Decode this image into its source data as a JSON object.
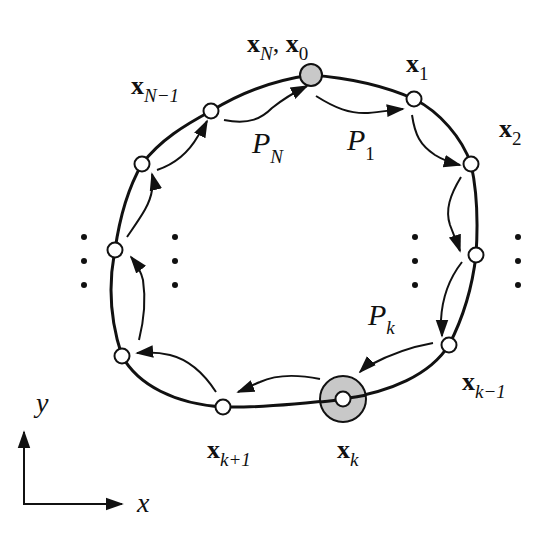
{
  "diagram": {
    "type": "closed-orbit-shooting",
    "colors": {
      "stroke": "#111111",
      "node_fill": "#ffffff",
      "highlight_fill": "#c8c8c8"
    },
    "nodes": [
      {
        "id": "x0",
        "label_main": "x",
        "label_sub": "N",
        "label_sep": ", ",
        "label_main2": "x",
        "label_sub2": "0",
        "highlighted": true
      },
      {
        "id": "x1",
        "label_main": "x",
        "label_sub": "1"
      },
      {
        "id": "x2",
        "label_main": "x",
        "label_sub": "2"
      },
      {
        "id": "xkm1",
        "label_main": "x",
        "label_sub": "k−1"
      },
      {
        "id": "xk",
        "label_main": "x",
        "label_sub": "k",
        "highlighted": true
      },
      {
        "id": "xkp1",
        "label_main": "x",
        "label_sub": "k+1"
      },
      {
        "id": "xNm1",
        "label_main": "x",
        "label_sub": "N−1"
      }
    ],
    "maps": [
      {
        "label_main": "P",
        "label_sub": "N"
      },
      {
        "label_main": "P",
        "label_sub": "1"
      },
      {
        "label_main": "P",
        "label_sub": "k"
      }
    ],
    "ellipsis": "⋮",
    "axes": {
      "x_label": "x",
      "y_label": "y"
    }
  }
}
